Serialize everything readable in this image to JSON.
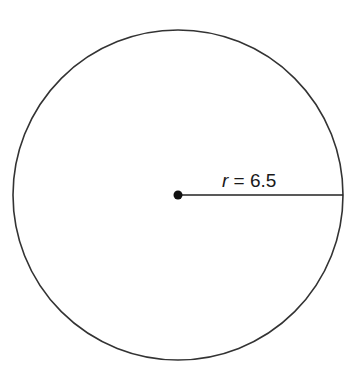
{
  "diagram": {
    "shape": "circle",
    "center": {
      "x": 178,
      "y": 195
    },
    "radius_px": 165,
    "stroke_color": "#333333",
    "radius_label": {
      "variable": "r",
      "equals": " = ",
      "value": "6.5"
    }
  }
}
